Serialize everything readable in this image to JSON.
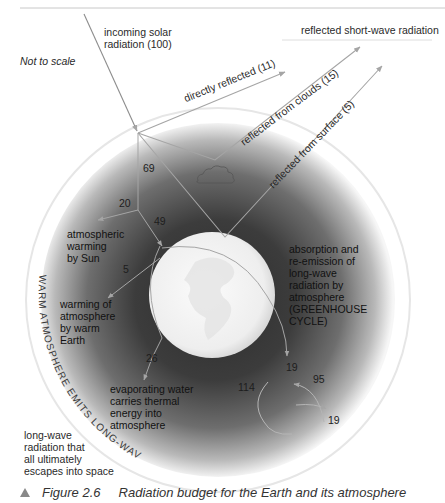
{
  "figure": {
    "caption_number": "Figure 2.6",
    "caption_text": "Radiation budget for the Earth and its atmosphere",
    "scale_note": "Not to scale"
  },
  "incoming": {
    "label_line1": "incoming solar",
    "label_line2": "radiation (100)"
  },
  "reflected": {
    "header": "reflected short-wave radiation",
    "directly": "directly reflected (11)",
    "clouds": "reflected from clouds (15)",
    "surface": "reflected from surface (5)"
  },
  "flows": {
    "n69": "69",
    "n20": "20",
    "n49": "49",
    "n5": "5",
    "n26": "26",
    "n19a": "19",
    "n95": "95",
    "n114": "114",
    "n19b": "19"
  },
  "labels": {
    "atm_sun": [
      "atmospheric",
      "warming",
      "by Sun"
    ],
    "atm_earth": [
      "warming of",
      "atmosphere",
      "by warm",
      "Earth"
    ],
    "evap": [
      "evaporating water",
      "carries thermal",
      "energy into",
      "atmosphere"
    ],
    "greenhouse": [
      "absorption and",
      "re-emission of",
      "long-wave",
      "radiation by",
      "atmosphere",
      "(GREENHOUSE",
      "CYCLE)"
    ],
    "escape": [
      "long-wave",
      "radiation that",
      "all ultimately",
      "escapes into space"
    ]
  },
  "arc_text": "WARM ATMOSPHERE EMITS LONG-WAVE RADIATION",
  "colors": {
    "atmosphere_dark": "#3a3a3a",
    "atmosphere_edge": "#f4f4f4",
    "earth": "#f2f2f2",
    "arrow": "#9a9a9a"
  }
}
